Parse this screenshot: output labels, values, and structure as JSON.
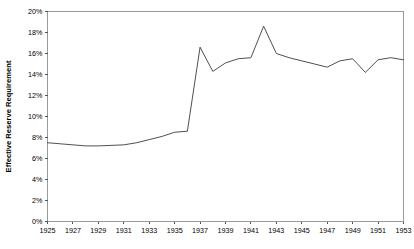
{
  "chart_data": {
    "type": "line",
    "title": "",
    "subtitle": "",
    "xlabel": "",
    "ylabel": "Effective Reserve Requirement",
    "xlim": [
      1925,
      1953
    ],
    "ylim": [
      0,
      20
    ],
    "grid": false,
    "legend": false,
    "legend_position": "none",
    "y_tick_labels": [
      "0%",
      "2%",
      "4%",
      "6%",
      "8%",
      "10%",
      "12%",
      "14%",
      "16%",
      "18%",
      "20%"
    ],
    "y_tick_values": [
      0,
      2,
      4,
      6,
      8,
      10,
      12,
      14,
      16,
      18,
      20
    ],
    "x_tick_labels": [
      "1925",
      "1927",
      "1929",
      "1931",
      "1933",
      "1935",
      "1937",
      "1939",
      "1941",
      "1943",
      "1945",
      "1947",
      "1949",
      "1951",
      "1953"
    ],
    "x_tick_values": [
      1925,
      1927,
      1929,
      1931,
      1933,
      1935,
      1937,
      1939,
      1941,
      1943,
      1945,
      1947,
      1949,
      1951,
      1953
    ],
    "x": [
      1925,
      1926,
      1927,
      1928,
      1929,
      1930,
      1931,
      1932,
      1933,
      1934,
      1935,
      1936,
      1937,
      1938,
      1939,
      1940,
      1941,
      1942,
      1943,
      1944,
      1945,
      1946,
      1947,
      1948,
      1949,
      1950,
      1951,
      1952,
      1953
    ],
    "series": [
      {
        "name": "Effective Reserve Requirement",
        "color": "#3c3c3c",
        "values": [
          7.5,
          7.4,
          7.3,
          7.2,
          7.2,
          7.25,
          7.3,
          7.5,
          7.8,
          8.1,
          8.5,
          8.6,
          16.6,
          14.3,
          15.1,
          15.5,
          15.6,
          18.6,
          16.0,
          15.6,
          15.3,
          15.0,
          14.7,
          15.3,
          15.5,
          14.2,
          15.4,
          15.6,
          15.4
        ]
      }
    ]
  }
}
